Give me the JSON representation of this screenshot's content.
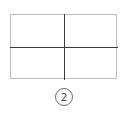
{
  "diagram": {
    "quadrants": 4,
    "label": "2"
  }
}
